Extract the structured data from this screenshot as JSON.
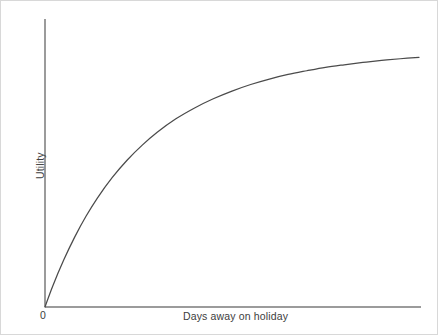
{
  "figure": {
    "origin_label": "0",
    "x_axis_label": "Days away on holiday",
    "y_axis_label": "Utility",
    "curve_color": "#4b4b4b",
    "axis_color": "#9b9b9b",
    "background_color": "#ffffff",
    "border_color": "#d8d8d8"
  },
  "chart_data": {
    "type": "line",
    "title": "",
    "subtitle": "",
    "xlabel": "Days away on holiday",
    "ylabel": "Utility",
    "legend": [],
    "legend_position": "none",
    "grid": false,
    "annotations": [],
    "x_tick_labels": [
      "0"
    ],
    "y_tick_labels": [],
    "xlim": [
      0,
      100
    ],
    "ylim": [
      0,
      100
    ],
    "series": [
      {
        "name": "Utility",
        "color": "#4b4b4b",
        "x": [
          0,
          2,
          5,
          8,
          11,
          14,
          18,
          22,
          26,
          30,
          35,
          40,
          45,
          50,
          55,
          60,
          65,
          70,
          75,
          80,
          85,
          90,
          95,
          100
        ],
        "y": [
          0,
          7.1,
          16.4,
          24.6,
          31.8,
          38.1,
          45.3,
          51.4,
          56.6,
          61.1,
          65.8,
          69.6,
          72.8,
          75.5,
          77.8,
          79.7,
          81.3,
          82.6,
          83.8,
          84.7,
          85.5,
          86.2,
          86.8,
          87.3
        ]
      }
    ]
  }
}
